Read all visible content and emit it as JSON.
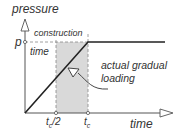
{
  "diagram": {
    "y_axis_label": "pressure",
    "x_axis_label": "time",
    "p_label": "p",
    "construction_label_1": "construction",
    "construction_label_2": "time",
    "annotation_1": "actual gradual",
    "annotation_2": "loading",
    "tick_half": "t",
    "tick_half_sub": "c",
    "tick_half_suffix": "/2",
    "tick_full": "t",
    "tick_full_sub": "c",
    "colors": {
      "line": "#222222",
      "shade": "#d9d9d9",
      "dash": "#888888"
    }
  }
}
